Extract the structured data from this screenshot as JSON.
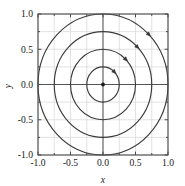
{
  "chart_data": {
    "type": "line",
    "title": "",
    "subtitle": "",
    "xlabel": "x",
    "ylabel": "y",
    "xlim": [
      -1.0,
      1.0
    ],
    "ylim": [
      -1.0,
      1.0
    ],
    "grid": true,
    "legend": null,
    "legend_position": "none",
    "xticks": [
      -1.0,
      -0.5,
      0.0,
      0.5,
      1.0
    ],
    "xticklabels": [
      "-1.0",
      "-0.5",
      "0.0",
      "0.5",
      "1.0"
    ],
    "yticks": [
      -1.0,
      -0.5,
      0.0,
      0.5,
      1.0
    ],
    "yticklabels": [
      "-1.0",
      "-0.5",
      "0.0",
      "0.5",
      "1.0"
    ],
    "minor_xticks": [
      -0.75,
      -0.25,
      0.25,
      0.75
    ],
    "minor_yticks": [
      -0.75,
      -0.25,
      0.25,
      0.75
    ],
    "series": [
      {
        "name": "orbit-r0.25",
        "shape": "circle",
        "center": [
          0.0,
          0.0
        ],
        "radius": 0.25,
        "direction": "clockwise",
        "arrow_at_deg": 45
      },
      {
        "name": "orbit-r0.50",
        "shape": "circle",
        "center": [
          0.0,
          0.0
        ],
        "radius": 0.5,
        "direction": "clockwise",
        "arrow_at_deg": 45
      },
      {
        "name": "orbit-r0.75",
        "shape": "circle",
        "center": [
          0.0,
          0.0
        ],
        "radius": 0.75,
        "direction": "clockwise",
        "arrow_at_deg": 45
      },
      {
        "name": "orbit-r1.00",
        "shape": "circle",
        "center": [
          0.0,
          0.0
        ],
        "radius": 1.0,
        "direction": "clockwise",
        "arrow_at_deg": 45
      }
    ],
    "fixed_points": [
      {
        "name": "center-fixed-point",
        "x": 0.0,
        "y": 0.0,
        "marker": "filled-dot"
      }
    ],
    "colors": {
      "curve": "#3a3a3a",
      "axis_line": "#555555",
      "grid": "#d6d6d6",
      "frame": "#4a4a4a",
      "text": "#1a1a1a",
      "background": "#ffffff"
    }
  }
}
